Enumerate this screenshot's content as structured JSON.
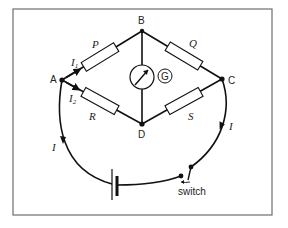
{
  "diagram": {
    "type": "Wheatstone bridge circuit",
    "nodes": {
      "A": "A",
      "B": "B",
      "C": "C",
      "D": "D"
    },
    "resistors": {
      "P": "P",
      "Q": "Q",
      "R": "R",
      "S": "S"
    },
    "currents": {
      "i1_main": "I",
      "i1_sub": "1",
      "i2_main": "I",
      "i2_sub": "2",
      "total_left": "I",
      "total_right": "I"
    },
    "galvanometer_label": "G",
    "switch_label": "switch",
    "colors": {
      "line": "#111111",
      "frame": "#6e6e6e",
      "background": "#ffffff"
    }
  }
}
